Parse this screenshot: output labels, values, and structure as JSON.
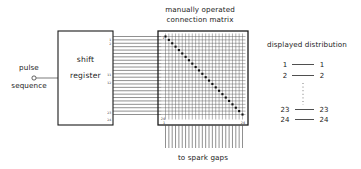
{
  "figure": {
    "background_color": "#ffffff",
    "ink_color": "#1a1a1a",
    "width": 361,
    "height": 169
  },
  "input": {
    "label_line1": "pulse",
    "label_line2": "sequence",
    "terminal_icon": "circle-terminal-icon"
  },
  "shift_register": {
    "label_line1": "shift",
    "label_line2": "register",
    "output_tap_labels": [
      "1",
      "2",
      "11",
      "12",
      "23",
      "24"
    ],
    "output_count": 24
  },
  "matrix": {
    "title_line1": "manually operated",
    "title_line2": "connection matrix",
    "corner_top_left": "1",
    "corner_bottom_left": "24",
    "corner_bottom_left_axis": "1",
    "corner_bottom_right": "24",
    "rows": 24,
    "columns": 24,
    "connection_pattern": "main-diagonal",
    "connection_count": 24
  },
  "output": {
    "label": "to spark gaps",
    "line_count": 24
  },
  "legend": {
    "title": "displayed distribution",
    "pairs": [
      {
        "left": "1",
        "right": "1"
      },
      {
        "left": "2",
        "right": "2"
      },
      {
        "left": "23",
        "right": "23"
      },
      {
        "left": "24",
        "right": "24"
      }
    ],
    "ellipsis_icon": "vertical-dots-icon"
  },
  "chart_data": {
    "type": "table",
    "title": "displayed distribution",
    "categories": [
      "1",
      "2",
      "23",
      "24"
    ],
    "series": [
      {
        "name": "shift register output",
        "values": [
          1,
          2,
          23,
          24
        ]
      },
      {
        "name": "spark gap channel",
        "values": [
          1,
          2,
          23,
          24
        ]
      }
    ],
    "mapping": "identity (diagonal connection matrix)",
    "xlabel": "shift register output",
    "ylabel": "spark gap channel",
    "grid": true,
    "legend_position": "right"
  }
}
